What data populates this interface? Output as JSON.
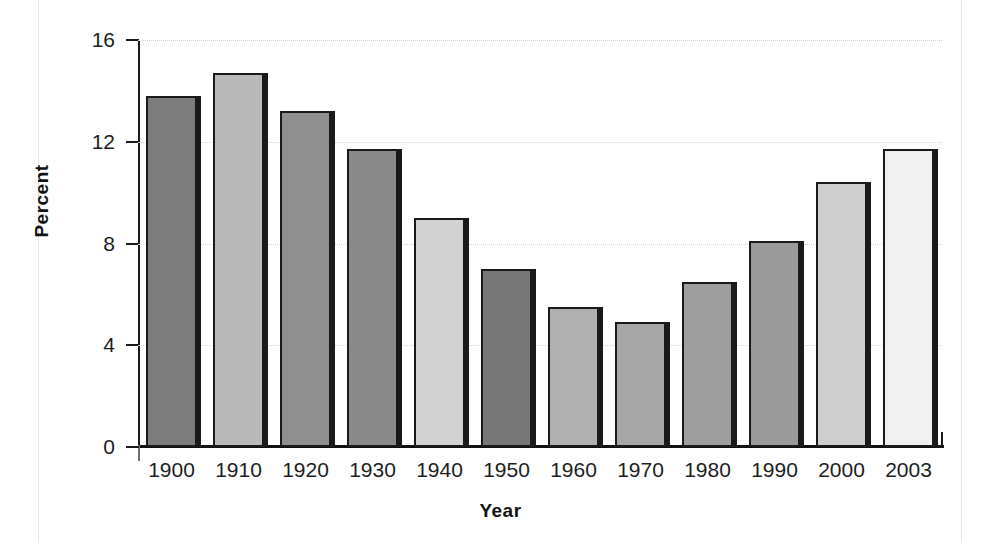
{
  "chart_data": {
    "type": "bar",
    "title": "",
    "subtitle": "",
    "xlabel": "Year",
    "ylabel": "Percent",
    "categories": [
      "1900",
      "1910",
      "1920",
      "1930",
      "1940",
      "1950",
      "1960",
      "1970",
      "1980",
      "1990",
      "2000",
      "2003"
    ],
    "values": [
      13.8,
      14.7,
      13.2,
      11.7,
      9.0,
      7.0,
      5.5,
      4.9,
      6.5,
      8.1,
      10.4,
      11.7
    ],
    "series": [
      {
        "name": "Percent",
        "values": [
          13.8,
          14.7,
          13.2,
          11.7,
          9.0,
          7.0,
          5.5,
          4.9,
          6.5,
          8.1,
          10.4,
          11.7
        ]
      }
    ],
    "bar_colors": [
      "#7c7c7c",
      "#b9b9b9",
      "#8f8f8f",
      "#8a8a8a",
      "#d2d2d2",
      "#777777",
      "#b0b0b0",
      "#a6a6a6",
      "#9e9e9e",
      "#9a9a9a",
      "#cfcfcf",
      "#f0f0f0"
    ],
    "ylim": [
      0,
      16
    ],
    "yticks": [
      0,
      4,
      8,
      12,
      16
    ],
    "ytick_labels": [
      "0",
      "4",
      "8",
      "12",
      "16"
    ],
    "grid": true,
    "grid_axis": "y",
    "grid_style": "dotted",
    "grid_color": "#d2d2d2",
    "legend": false,
    "legend_position": "none",
    "axis_color": "#1a1a1a",
    "background": "#ffffff",
    "bar_edge_color": "#1a1a1a",
    "annotations": []
  }
}
